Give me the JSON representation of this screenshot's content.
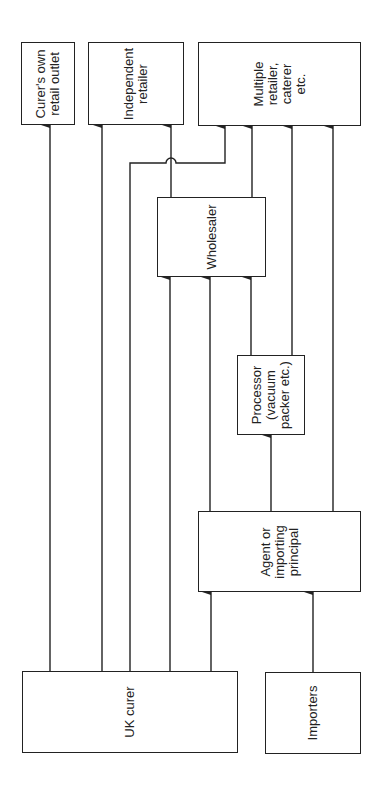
{
  "diagram": {
    "orientation": "rotated-90-ccw",
    "nodes": {
      "curers_own": {
        "label": "Curer's own\nretail outlet"
      },
      "independent": {
        "label": "Independent\nretailer"
      },
      "multiple": {
        "label": "Multiple\nretailer,\ncaterer\netc."
      },
      "wholesaler": {
        "label": "Wholesaler"
      },
      "processor": {
        "label": "Processor\n(vacuum\npacker etc.)"
      },
      "agent": {
        "label": "Agent or\nimporting\nprincipal"
      },
      "uk_curer": {
        "label": "UK curer"
      },
      "importers": {
        "label": "Importers"
      }
    },
    "edges": [
      {
        "from": "UK curer",
        "to": "Curer's own retail outlet"
      },
      {
        "from": "UK curer",
        "to": "Independent retailer"
      },
      {
        "from": "UK curer",
        "to": "Multiple retailer, caterer etc."
      },
      {
        "from": "UK curer",
        "to": "Wholesaler"
      },
      {
        "from": "UK curer",
        "to": "Agent or importing principal"
      },
      {
        "from": "Importers",
        "to": "Agent or importing principal"
      },
      {
        "from": "Agent or importing principal",
        "to": "Wholesaler"
      },
      {
        "from": "Agent or importing principal",
        "to": "Processor (vacuum packer etc.)"
      },
      {
        "from": "Agent or importing principal",
        "to": "Multiple retailer, caterer etc."
      },
      {
        "from": "Processor (vacuum packer etc.)",
        "to": "Wholesaler"
      },
      {
        "from": "Processor (vacuum packer etc.)",
        "to": "Multiple retailer, caterer etc."
      },
      {
        "from": "Wholesaler",
        "to": "Independent retailer"
      },
      {
        "from": "Wholesaler",
        "to": "Multiple retailer, caterer etc."
      }
    ]
  }
}
